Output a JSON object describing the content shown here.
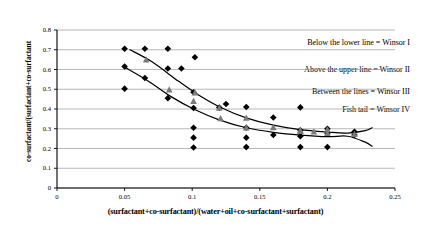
{
  "chart_data": {
    "type": "scatter",
    "title": "",
    "xlabel": "(surfactant+co-surfactant)/(water+oil+co-surfactant+surfactant)",
    "ylabel": "co-surfactant/(surfactant+co-surfactant",
    "xlim": [
      0,
      0.25
    ],
    "ylim": [
      0,
      0.8
    ],
    "xticks": [
      "0",
      "0.05",
      "0.1",
      "0.15",
      "0.2",
      "0.25"
    ],
    "xtick_values": [
      0,
      0.05,
      0.1,
      0.15,
      0.2,
      0.25
    ],
    "yticks": [
      "0",
      "0.1",
      "0.2",
      "0.3",
      "0.4",
      "0.5",
      "0.6",
      "0.7",
      "0.8"
    ],
    "ytick_values": [
      0,
      0.1,
      0.2,
      0.3,
      0.4,
      0.5,
      0.6,
      0.7,
      0.8
    ],
    "grid": "horizontal",
    "legend": "none",
    "series": [
      {
        "name": "diamond-points",
        "marker": "diamond",
        "color": "#000000",
        "points": [
          [
            0.05,
            0.705
          ],
          [
            0.065,
            0.705
          ],
          [
            0.082,
            0.705
          ],
          [
            0.05,
            0.615
          ],
          [
            0.065,
            0.557
          ],
          [
            0.05,
            0.503
          ],
          [
            0.082,
            0.455
          ],
          [
            0.082,
            0.605
          ],
          [
            0.092,
            0.605
          ],
          [
            0.102,
            0.662
          ],
          [
            0.101,
            0.485
          ],
          [
            0.101,
            0.405
          ],
          [
            0.101,
            0.305
          ],
          [
            0.101,
            0.255
          ],
          [
            0.101,
            0.205
          ],
          [
            0.12,
            0.407
          ],
          [
            0.125,
            0.425
          ],
          [
            0.14,
            0.41
          ],
          [
            0.14,
            0.305
          ],
          [
            0.14,
            0.255
          ],
          [
            0.14,
            0.207
          ],
          [
            0.16,
            0.357
          ],
          [
            0.16,
            0.268
          ],
          [
            0.18,
            0.408
          ],
          [
            0.18,
            0.292
          ],
          [
            0.18,
            0.262
          ],
          [
            0.18,
            0.207
          ],
          [
            0.2,
            0.3
          ],
          [
            0.2,
            0.277
          ],
          [
            0.2,
            0.207
          ],
          [
            0.22,
            0.285
          ],
          [
            0.22,
            0.268
          ]
        ]
      },
      {
        "name": "triangle-points",
        "marker": "triangle",
        "color": "#7a7a7a",
        "points": [
          [
            0.066,
            0.65
          ],
          [
            0.083,
            0.498
          ],
          [
            0.101,
            0.44
          ],
          [
            0.102,
            0.482
          ],
          [
            0.12,
            0.405
          ],
          [
            0.121,
            0.352
          ],
          [
            0.14,
            0.355
          ],
          [
            0.14,
            0.305
          ],
          [
            0.16,
            0.307
          ],
          [
            0.18,
            0.292
          ],
          [
            0.18,
            0.287
          ],
          [
            0.19,
            0.285
          ],
          [
            0.2,
            0.295
          ],
          [
            0.2,
            0.277
          ],
          [
            0.22,
            0.272
          ]
        ]
      }
    ],
    "curves": [
      {
        "name": "upper-boundary-line",
        "description": "Upper Winsor boundary curve, ends in fish tail crossing",
        "path": [
          [
            0.054,
            0.7
          ],
          [
            0.07,
            0.64
          ],
          [
            0.09,
            0.54
          ],
          [
            0.105,
            0.47
          ],
          [
            0.122,
            0.405
          ],
          [
            0.14,
            0.355
          ],
          [
            0.16,
            0.318
          ],
          [
            0.18,
            0.295
          ],
          [
            0.2,
            0.283
          ],
          [
            0.215,
            0.278
          ],
          [
            0.228,
            0.29
          ],
          [
            0.233,
            0.305
          ]
        ]
      },
      {
        "name": "lower-boundary-line",
        "description": "Lower Winsor boundary curve, ends in fish tail crossing",
        "path": [
          [
            0.05,
            0.612
          ],
          [
            0.066,
            0.548
          ],
          [
            0.085,
            0.46
          ],
          [
            0.101,
            0.4
          ],
          [
            0.12,
            0.345
          ],
          [
            0.14,
            0.305
          ],
          [
            0.16,
            0.282
          ],
          [
            0.18,
            0.268
          ],
          [
            0.2,
            0.26
          ],
          [
            0.215,
            0.262
          ],
          [
            0.228,
            0.232
          ],
          [
            0.233,
            0.212
          ]
        ]
      }
    ],
    "annotations": [
      {
        "text": "Below the lower line = Winsor I"
      },
      {
        "text": "Above the upper line = Winsor II"
      },
      {
        "text": "Between the lines = Winsor III"
      },
      {
        "text": "Fish tail = Winsor IV"
      }
    ]
  }
}
